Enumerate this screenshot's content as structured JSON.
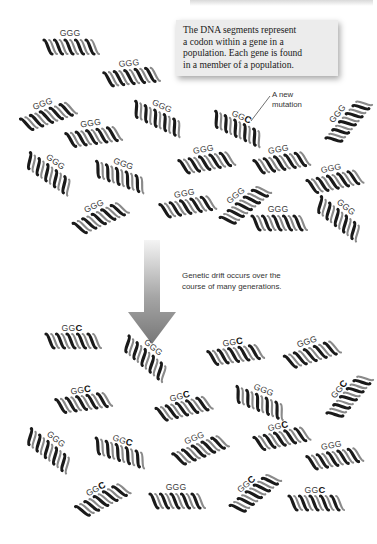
{
  "header": {
    "running_head": ""
  },
  "callout": {
    "lines": [
      "The DNA segments represent",
      "a codon within a gene in a",
      "population. Each gene is found",
      "in a member of a population."
    ],
    "background": "#ececec"
  },
  "mutation_label": {
    "lines": [
      "A new",
      "mutation"
    ]
  },
  "drift_label": {
    "lines": [
      "Genetic drift occurs over the",
      "course of many generations."
    ]
  },
  "arrow": {
    "color_top": "#f2f2f2",
    "color_bottom": "#7a7a7a",
    "direction": "down"
  },
  "before_population": {
    "segments": [
      {
        "x": 40,
        "y": 28,
        "rot": 0,
        "prefix": "GG",
        "last": "G",
        "mutant": false
      },
      {
        "x": 100,
        "y": 58,
        "rot": -6,
        "prefix": "GG",
        "last": "G",
        "mutant": false
      },
      {
        "x": 16,
        "y": 98,
        "rot": -20,
        "prefix": "GG",
        "last": "G",
        "mutant": false
      },
      {
        "x": 128,
        "y": 100,
        "rot": 25,
        "prefix": "GG",
        "last": "G",
        "mutant": false
      },
      {
        "x": 62,
        "y": 118,
        "rot": -8,
        "prefix": "GG",
        "last": "G",
        "mutant": false
      },
      {
        "x": 208,
        "y": 110,
        "rot": 25,
        "prefix": "GG",
        "last": "C",
        "mutant": true
      },
      {
        "x": 315,
        "y": 105,
        "rot": -50,
        "prefix": "GG",
        "last": "G",
        "mutant": false
      },
      {
        "x": 20,
        "y": 155,
        "rot": 35,
        "prefix": "GG",
        "last": "G",
        "mutant": false
      },
      {
        "x": 90,
        "y": 158,
        "rot": 20,
        "prefix": "GG",
        "last": "G",
        "mutant": false
      },
      {
        "x": 175,
        "y": 144,
        "rot": -10,
        "prefix": "GG",
        "last": "G",
        "mutant": false
      },
      {
        "x": 250,
        "y": 144,
        "rot": -10,
        "prefix": "GG",
        "last": "G",
        "mutant": false
      },
      {
        "x": 303,
        "y": 163,
        "rot": -12,
        "prefix": "GG",
        "last": "G",
        "mutant": false
      },
      {
        "x": 68,
        "y": 200,
        "rot": -25,
        "prefix": "GG",
        "last": "G",
        "mutant": false
      },
      {
        "x": 156,
        "y": 188,
        "rot": -10,
        "prefix": "GG",
        "last": "G",
        "mutant": false
      },
      {
        "x": 212,
        "y": 188,
        "rot": -40,
        "prefix": "GG",
        "last": "G",
        "mutant": false
      },
      {
        "x": 248,
        "y": 204,
        "rot": 0,
        "prefix": "GG",
        "last": "G",
        "mutant": false
      },
      {
        "x": 310,
        "y": 200,
        "rot": 38,
        "prefix": "GG",
        "last": "G",
        "mutant": false
      }
    ]
  },
  "after_population": {
    "segments": [
      {
        "x": 42,
        "y": 322,
        "rot": 0,
        "prefix": "GG",
        "last": "C",
        "mutant": true
      },
      {
        "x": 117,
        "y": 340,
        "rot": 40,
        "prefix": "GG",
        "last": "G",
        "mutant": false
      },
      {
        "x": 204,
        "y": 336,
        "rot": -8,
        "prefix": "GG",
        "last": "C",
        "mutant": true
      },
      {
        "x": 280,
        "y": 336,
        "rot": -18,
        "prefix": "GG",
        "last": "G",
        "mutant": false
      },
      {
        "x": 52,
        "y": 384,
        "rot": -8,
        "prefix": "GG",
        "last": "C",
        "mutant": true
      },
      {
        "x": 152,
        "y": 390,
        "rot": -14,
        "prefix": "GG",
        "last": "C",
        "mutant": true
      },
      {
        "x": 230,
        "y": 384,
        "rot": 22,
        "prefix": "GG",
        "last": "G",
        "mutant": false
      },
      {
        "x": 316,
        "y": 380,
        "rot": -50,
        "prefix": "GG",
        "last": "C",
        "mutant": true
      },
      {
        "x": 20,
        "y": 432,
        "rot": 38,
        "prefix": "GG",
        "last": "G",
        "mutant": false
      },
      {
        "x": 90,
        "y": 434,
        "rot": 18,
        "prefix": "GG",
        "last": "C",
        "mutant": true
      },
      {
        "x": 168,
        "y": 432,
        "rot": -22,
        "prefix": "GG",
        "last": "G",
        "mutant": false
      },
      {
        "x": 250,
        "y": 420,
        "rot": -12,
        "prefix": "GG",
        "last": "C",
        "mutant": true
      },
      {
        "x": 303,
        "y": 440,
        "rot": -10,
        "prefix": "GG",
        "last": "G",
        "mutant": false
      },
      {
        "x": 70,
        "y": 482,
        "rot": -28,
        "prefix": "GG",
        "last": "C",
        "mutant": true
      },
      {
        "x": 146,
        "y": 482,
        "rot": 0,
        "prefix": "GG",
        "last": "G",
        "mutant": false
      },
      {
        "x": 222,
        "y": 476,
        "rot": -40,
        "prefix": "GG",
        "last": "C",
        "mutant": true
      },
      {
        "x": 285,
        "y": 484,
        "rot": 0,
        "prefix": "GG",
        "last": "C",
        "mutant": true
      }
    ]
  },
  "colors": {
    "helix_dark": "#1a1a1a",
    "helix_light": "#9a9a9a",
    "text": "#333333"
  }
}
